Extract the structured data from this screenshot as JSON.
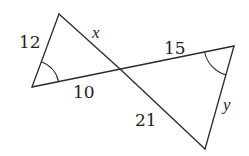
{
  "diagram": {
    "type": "two triangles sharing a vertex (bowtie) with marked congruent angles",
    "colors": {
      "stroke": "#2a2a2a",
      "text": "#222222",
      "background": "#ffffff"
    },
    "vertices": {
      "top_left": [
        59,
        14
      ],
      "bottom_left": [
        32,
        87
      ],
      "intersection": [
        120,
        69
      ],
      "right": [
        234,
        46
      ],
      "bottom_right": [
        205,
        149
      ]
    },
    "labels": {
      "left_side": "12",
      "top_side": "x",
      "bottom_left_side": "10",
      "top_right_side": "15",
      "bottom_right_side": "21",
      "right_side": "y"
    },
    "angle_marks": [
      {
        "vertex": "bottom_left",
        "marker": "single-arc"
      },
      {
        "vertex": "right",
        "marker": "single-arc"
      }
    ]
  }
}
